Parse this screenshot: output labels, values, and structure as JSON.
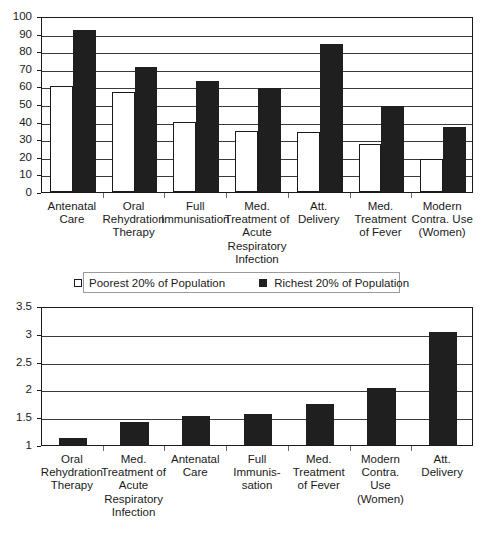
{
  "legend": {
    "items": [
      {
        "key": "poorest",
        "label": "Poorest 20% of Population",
        "swatch": "light"
      },
      {
        "key": "richest",
        "label": "Richest 20% of Population",
        "swatch": "dark"
      }
    ]
  },
  "chart_data": [
    {
      "id": "coverage-by-wealth-quintile",
      "type": "bar",
      "title": "",
      "xlabel": "",
      "ylabel": "",
      "ylim": [
        0,
        100
      ],
      "ytick_labels": [
        "0",
        "10",
        "20",
        "30",
        "40",
        "50",
        "60",
        "70",
        "80",
        "90",
        "100"
      ],
      "ytick_values": [
        0,
        10,
        20,
        30,
        40,
        50,
        60,
        70,
        80,
        90,
        100
      ],
      "grid": true,
      "legend_position": "below-plot",
      "categories": [
        "Antenatal Care",
        "Oral Rehydration Therapy",
        "Full Immunisation",
        "Med. Treatment of Acute Respiratory Infection",
        "Att. Delivery",
        "Med. Treatment of Fever",
        "Modern Contra. Use (Women)"
      ],
      "category_label_lines": [
        [
          "Antenatal",
          "Care"
        ],
        [
          "Oral",
          "Rehydration",
          "Therapy"
        ],
        [
          "Full",
          "Immunisation"
        ],
        [
          "Med.",
          "Treatment of",
          "Acute",
          "Respiratory",
          "Infection"
        ],
        [
          "Att.",
          "Delivery"
        ],
        [
          "Med.",
          "Treatment",
          "of Fever"
        ],
        [
          "Modern",
          "Contra. Use",
          "(Women)"
        ]
      ],
      "series": [
        {
          "name": "Poorest 20% of Population",
          "style": "light",
          "values": [
            60,
            57,
            40,
            34.5,
            34,
            27,
            19
          ]
        },
        {
          "name": "Richest 20% of Population",
          "style": "dark",
          "values": [
            92,
            71,
            63,
            59,
            84,
            49,
            37
          ]
        }
      ]
    },
    {
      "id": "richest-to-poorest-ratio",
      "type": "bar",
      "title": "",
      "xlabel": "",
      "ylabel": "",
      "ylim": [
        1,
        3.5
      ],
      "ytick_labels": [
        "1",
        "1.5",
        "2",
        "2.5",
        "3",
        "3.5"
      ],
      "ytick_values": [
        1,
        1.5,
        2,
        2.5,
        3,
        3.5
      ],
      "grid": true,
      "legend_position": "none",
      "categories": [
        "Oral Rehydration Therapy",
        "Med. Treatment of Acute Respiratory Infection",
        "Antenatal Care",
        "Full Immunisation",
        "Med. Treatment of Fever",
        "Modern Contra. Use (Women)",
        "Att. Delivery"
      ],
      "category_label_lines": [
        [
          "Oral",
          "Rehydration",
          "Therapy"
        ],
        [
          "Med.",
          "Treatment of",
          "Acute",
          "Respiratory",
          "Infection"
        ],
        [
          "Antenatal",
          "Care"
        ],
        [
          "Full",
          "Immunis-",
          "sation"
        ],
        [
          "Med.",
          "Treatment",
          "of Fever"
        ],
        [
          "Modern",
          "Contra.",
          "Use",
          "(Women)"
        ],
        [
          "Att.",
          "Delivery"
        ]
      ],
      "series": [
        {
          "name": "Ratio",
          "style": "dark",
          "values": [
            1.13,
            1.42,
            1.52,
            1.56,
            1.74,
            2.02,
            3.03
          ]
        }
      ]
    }
  ],
  "colors": {
    "bar_dark": "#1f1f1f",
    "bar_light": "#ffffff",
    "axis": "#1a1a1a",
    "grid": "#3a3a3a",
    "background": "#ffffff"
  }
}
